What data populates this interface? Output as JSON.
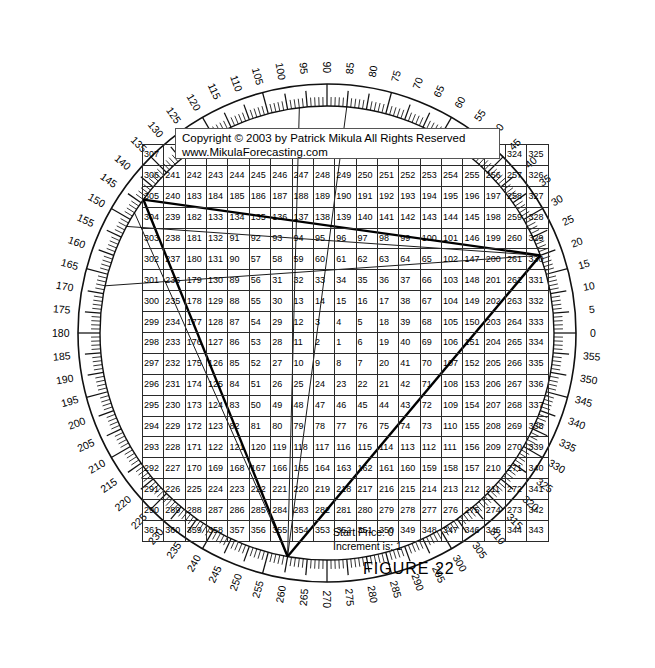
{
  "figure": {
    "title": "FIGURE  22",
    "copyright_line1": "Copyright © 2003 by Patrick Mikula All Rights Reserved",
    "copyright_line2": "www.MikulaForecasting.com",
    "start_price_label": "Start Price: 0",
    "increment_label": "Increment is: 1"
  },
  "chart_data": {
    "type": "table",
    "title": "FIGURE  22",
    "grid": {
      "rows": 20,
      "cols": 19,
      "center_value": 1,
      "start_price": 0,
      "increment": 1,
      "spiral_direction": "counterclockwise",
      "values": [
        [
          307,
          308,
          309,
          310,
          311,
          312,
          313,
          314,
          315,
          316,
          317,
          318,
          319,
          320,
          321,
          322,
          323,
          324,
          325
        ],
        [
          306,
          241,
          242,
          243,
          244,
          245,
          246,
          247,
          248,
          249,
          250,
          251,
          252,
          253,
          254,
          255,
          256,
          257,
          326
        ],
        [
          305,
          240,
          183,
          184,
          185,
          186,
          187,
          188,
          189,
          190,
          191,
          192,
          193,
          194,
          195,
          196,
          197,
          258,
          327
        ],
        [
          304,
          239,
          182,
          133,
          134,
          135,
          136,
          137,
          138,
          139,
          140,
          141,
          142,
          143,
          144,
          145,
          198,
          259,
          328
        ],
        [
          303,
          238,
          181,
          132,
          91,
          92,
          93,
          94,
          95,
          96,
          97,
          98,
          99,
          100,
          101,
          146,
          199,
          260,
          329
        ],
        [
          302,
          237,
          180,
          131,
          90,
          57,
          58,
          59,
          60,
          61,
          62,
          63,
          64,
          65,
          102,
          147,
          200,
          261,
          330
        ],
        [
          301,
          236,
          179,
          130,
          89,
          56,
          31,
          32,
          33,
          34,
          35,
          36,
          37,
          66,
          103,
          148,
          201,
          262,
          331
        ],
        [
          300,
          235,
          178,
          129,
          88,
          55,
          30,
          13,
          14,
          15,
          16,
          17,
          38,
          67,
          104,
          149,
          202,
          263,
          332
        ],
        [
          299,
          234,
          177,
          128,
          87,
          54,
          29,
          12,
          3,
          4,
          5,
          18,
          39,
          68,
          105,
          150,
          203,
          264,
          333
        ],
        [
          298,
          233,
          176,
          127,
          86,
          53,
          28,
          11,
          2,
          1,
          6,
          19,
          40,
          69,
          106,
          151,
          204,
          265,
          334
        ],
        [
          297,
          232,
          175,
          126,
          85,
          52,
          27,
          10,
          9,
          8,
          7,
          20,
          41,
          70,
          107,
          152,
          205,
          266,
          335
        ],
        [
          296,
          231,
          174,
          125,
          84,
          51,
          26,
          25,
          24,
          23,
          22,
          21,
          42,
          71,
          108,
          153,
          206,
          267,
          336
        ],
        [
          295,
          230,
          173,
          124,
          83,
          50,
          49,
          48,
          47,
          46,
          45,
          44,
          43,
          72,
          109,
          154,
          207,
          268,
          337
        ],
        [
          294,
          229,
          172,
          123,
          82,
          81,
          80,
          79,
          78,
          77,
          76,
          75,
          74,
          73,
          110,
          155,
          208,
          269,
          338
        ],
        [
          293,
          228,
          171,
          122,
          121,
          120,
          119,
          118,
          117,
          116,
          115,
          114,
          113,
          112,
          111,
          156,
          209,
          270,
          339
        ],
        [
          292,
          227,
          170,
          169,
          168,
          167,
          166,
          165,
          164,
          163,
          162,
          161,
          160,
          159,
          158,
          157,
          210,
          271,
          340
        ],
        [
          291,
          226,
          225,
          224,
          223,
          222,
          221,
          220,
          219,
          218,
          217,
          216,
          215,
          214,
          213,
          212,
          211,
          272,
          341
        ],
        [
          290,
          289,
          288,
          287,
          286,
          285,
          284,
          283,
          282,
          281,
          280,
          279,
          278,
          277,
          276,
          275,
          274,
          273,
          342
        ],
        [
          361,
          360,
          359,
          358,
          357,
          356,
          355,
          354,
          353,
          352,
          351,
          350,
          349,
          348,
          347,
          346,
          345,
          344,
          343
        ]
      ]
    },
    "wheel": {
      "degree_min": 0,
      "degree_max": 355,
      "label_step": 5,
      "minor_tick_step": 1,
      "zero_at": "east",
      "direction": "counterclockwise",
      "labels": [
        0,
        5,
        10,
        15,
        20,
        25,
        30,
        35,
        40,
        45,
        50,
        55,
        60,
        65,
        70,
        75,
        80,
        85,
        90,
        95,
        100,
        105,
        110,
        115,
        120,
        125,
        130,
        135,
        140,
        145,
        150,
        155,
        160,
        165,
        170,
        175,
        180,
        185,
        190,
        195,
        200,
        205,
        210,
        215,
        220,
        225,
        230,
        235,
        240,
        245,
        250,
        255,
        260,
        265,
        270,
        275,
        280,
        285,
        290,
        295,
        300,
        305,
        310,
        315,
        320,
        325,
        330,
        335,
        340,
        345,
        350,
        355
      ]
    },
    "angle_lines": [
      {
        "from_deg": 20,
        "to_deg": 144,
        "note": "thick ray to upper-left rim"
      },
      {
        "from_deg": 20,
        "to_deg": 152,
        "note": "thin ray to upper-left rim"
      },
      {
        "from_deg": 20,
        "to_deg": 260,
        "note": "thick ray to bottom rim"
      },
      {
        "from_deg": 260,
        "to_deg": 144,
        "note": "thick ray bottom to upper-left"
      },
      {
        "from_deg": 260,
        "to_deg": 148,
        "note": "thin ray bottom to upper-left"
      },
      {
        "from_deg": 260,
        "to_deg": 97,
        "note": "thin ray bottom to top"
      },
      {
        "from_deg": 260,
        "to_deg": 85,
        "note": "thin ray bottom to top"
      }
    ]
  },
  "colors": {
    "ink": "#000000",
    "grid_line": "#2a2a2a",
    "background": "#ffffff"
  }
}
